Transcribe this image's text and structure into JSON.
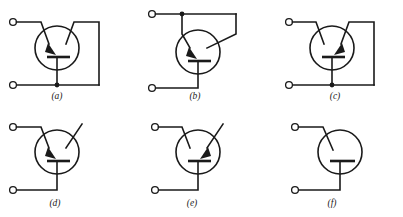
{
  "figure": {
    "kind": "electronic-schematic-set",
    "background_color": "#ffffff",
    "line_color": "#1a1a1a",
    "panel_count": 6,
    "columns": 3,
    "rows": 2
  },
  "panels": [
    {
      "id": "a",
      "label": "(a)",
      "label_x": 57,
      "label_y": 99,
      "transistor_type": "npn",
      "arrow_side": "left",
      "emitter_arrow_direction": "inward",
      "base_lead": "left-terminal-diagonal",
      "collector_lead": "right-diagonal-to-bus",
      "bottom_lead": "vertical-down-to-bottom-rail",
      "has_bottom_junction_dot": true,
      "terminal_count": 2,
      "terminals": [
        "upper-left",
        "lower-left"
      ],
      "right_bus": true
    },
    {
      "id": "b",
      "label": "(b)",
      "label_x": 195,
      "label_y": 99,
      "transistor_type": "npn",
      "arrow_side": "left",
      "emitter_arrow_direction": "inward",
      "base_lead": "top-rail-left-descending",
      "collector_lead": "top-rail-right-descending",
      "bottom_lead": "vertical-down-then-left-to-terminal",
      "has_top_junction_dot": true,
      "terminal_count": 2,
      "terminals": [
        "upper-left",
        "lower-left"
      ],
      "right_bus": false
    },
    {
      "id": "c",
      "label": "(c)",
      "label_x": 335,
      "label_y": 99,
      "transistor_type": "pnp",
      "arrow_side": "right",
      "emitter_arrow_direction": "inward",
      "base_lead": "left-terminal-diagonal",
      "collector_lead": "right-diagonal-to-bus",
      "bottom_lead": "vertical-down-to-bottom-rail",
      "has_bottom_junction_dot": true,
      "terminal_count": 2,
      "terminals": [
        "upper-left",
        "lower-left"
      ],
      "right_bus": true
    },
    {
      "id": "d",
      "label": "(d)",
      "label_x": 55,
      "label_y": 206,
      "transistor_type": "npn",
      "arrow_side": "left",
      "emitter_arrow_direction": "inward",
      "base_lead": "left-terminal-diagonal",
      "collector_lead": "open-diagonal-upper-right",
      "bottom_lead": "vertical-down-then-left-to-terminal",
      "has_bottom_junction_dot": false,
      "terminal_count": 2,
      "terminals": [
        "upper-left",
        "lower-left"
      ],
      "right_bus": false
    },
    {
      "id": "e",
      "label": "(e)",
      "label_x": 192,
      "label_y": 206,
      "transistor_type": "pnp",
      "arrow_side": "right",
      "emitter_arrow_direction": "inward",
      "base_lead": "left-terminal-diagonal",
      "collector_lead": "open-diagonal-upper-right",
      "bottom_lead": "vertical-down-then-left-to-terminal",
      "has_bottom_junction_dot": false,
      "terminal_count": 2,
      "terminals": [
        "upper-left",
        "lower-left"
      ],
      "right_bus": false
    },
    {
      "id": "f",
      "label": "(f)",
      "label_x": 332,
      "label_y": 206,
      "transistor_type": "diode-connected",
      "arrow_side": "none",
      "emitter_arrow_direction": "none",
      "base_lead": "left-terminal-diagonal",
      "collector_lead": "none",
      "bottom_lead": "vertical-down-then-left-to-terminal",
      "has_bottom_junction_dot": false,
      "terminal_count": 2,
      "terminals": [
        "upper-left",
        "lower-left"
      ],
      "right_bus": false
    }
  ]
}
